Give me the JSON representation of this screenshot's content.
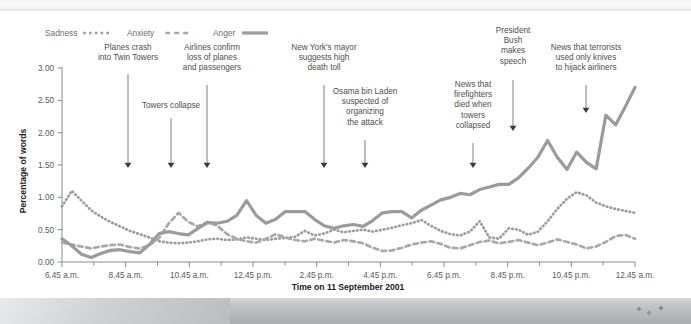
{
  "chart_data": {
    "type": "line",
    "title": "",
    "xlabel": "Time on 11 September 2001",
    "ylabel": "Percentage of words",
    "ylim": [
      0.0,
      3.0
    ],
    "y_ticks": [
      "0.00",
      "0.50",
      "1.00",
      "1.50",
      "2.00",
      "2.50",
      "3.00"
    ],
    "y_tick_values": [
      0.0,
      0.5,
      1.0,
      1.5,
      2.0,
      2.5,
      3.0
    ],
    "grid": false,
    "legend_position": "top-left",
    "x_tick_labels": [
      "6.45 a.m.",
      "8.45 a.m.",
      "10.45 a.m.",
      "12.45 p.m.",
      "2.45 p.m.",
      "4.45 p.m.",
      "6.45 p.m.",
      "8.45 p.m.",
      "10.45 p.m.",
      "12.45 a.m."
    ],
    "x_minor_ticks_per_label": 2,
    "x_hours": [
      6.75,
      7.75,
      8.75,
      9.75,
      10.75,
      11.75,
      12.75,
      13.75,
      14.75,
      15.75,
      16.75,
      17.75,
      18.75,
      19.75,
      20.75,
      21.75,
      22.75,
      23.75,
      24.75
    ],
    "series": [
      {
        "name": "Sadness",
        "style": "dotted",
        "color": "#9b9c9e",
        "values": [
          0.86,
          1.1,
          0.95,
          0.8,
          0.7,
          0.62,
          0.55,
          0.48,
          0.43,
          0.38,
          0.32,
          0.3,
          0.29,
          0.3,
          0.32,
          0.35,
          0.36,
          0.34,
          0.35,
          0.38,
          0.36,
          0.34,
          0.36,
          0.37,
          0.39,
          0.48,
          0.41,
          0.44,
          0.5,
          0.46,
          0.48,
          0.5,
          0.47,
          0.5,
          0.53,
          0.57,
          0.6,
          0.65,
          0.56,
          0.48,
          0.43,
          0.41,
          0.47,
          0.63,
          0.38,
          0.36,
          0.52,
          0.5,
          0.42,
          0.47,
          0.63,
          0.82,
          0.98,
          1.08,
          1.03,
          0.92,
          0.86,
          0.82,
          0.79,
          0.76
        ]
      },
      {
        "name": "Anxiety",
        "style": "dashed",
        "color": "#a7a8aa",
        "values": [
          0.3,
          0.27,
          0.24,
          0.21,
          0.24,
          0.26,
          0.27,
          0.23,
          0.21,
          0.26,
          0.37,
          0.6,
          0.76,
          0.62,
          0.55,
          0.62,
          0.56,
          0.43,
          0.36,
          0.32,
          0.3,
          0.36,
          0.43,
          0.38,
          0.34,
          0.32,
          0.36,
          0.33,
          0.3,
          0.34,
          0.32,
          0.29,
          0.22,
          0.17,
          0.18,
          0.22,
          0.27,
          0.3,
          0.32,
          0.28,
          0.22,
          0.21,
          0.26,
          0.31,
          0.33,
          0.29,
          0.31,
          0.34,
          0.3,
          0.26,
          0.3,
          0.35,
          0.31,
          0.27,
          0.21,
          0.24,
          0.31,
          0.4,
          0.42,
          0.36
        ]
      },
      {
        "name": "Anger",
        "style": "solid",
        "color": "#9a9b9d",
        "values": [
          0.36,
          0.25,
          0.12,
          0.07,
          0.13,
          0.18,
          0.19,
          0.16,
          0.14,
          0.27,
          0.44,
          0.47,
          0.44,
          0.42,
          0.52,
          0.61,
          0.6,
          0.63,
          0.72,
          0.95,
          0.72,
          0.6,
          0.66,
          0.78,
          0.78,
          0.78,
          0.66,
          0.56,
          0.52,
          0.56,
          0.58,
          0.55,
          0.64,
          0.76,
          0.78,
          0.78,
          0.68,
          0.8,
          0.88,
          0.96,
          1.0,
          1.06,
          1.04,
          1.12,
          1.16,
          1.2,
          1.2,
          1.3,
          1.45,
          1.62,
          1.88,
          1.62,
          1.43,
          1.7,
          1.54,
          1.44,
          2.27,
          2.12,
          2.4,
          2.7
        ]
      }
    ],
    "annotations": [
      {
        "id": "planes-crash",
        "lines": [
          "Planes crash",
          "into Twin Towers"
        ],
        "text_x": 128,
        "text_top": 50,
        "arrow_x": 128,
        "arrow_from": 74,
        "arrow_to": 168,
        "align": "center"
      },
      {
        "id": "towers-collapse",
        "lines": [
          "Towers collapse"
        ],
        "text_x": 171,
        "text_top": 108,
        "arrow_x": 171,
        "arrow_from": 118,
        "arrow_to": 168,
        "align": "center"
      },
      {
        "id": "airlines-confirm",
        "lines": [
          "Airlines confirm",
          "loss of planes",
          "and passengers"
        ],
        "text_x": 212,
        "text_top": 50,
        "arrow_x": 207,
        "arrow_from": 85,
        "arrow_to": 168,
        "align": "center"
      },
      {
        "id": "nyc-mayor",
        "lines": [
          "New York's mayor",
          "suggests high",
          "death toll"
        ],
        "text_x": 324,
        "text_top": 50,
        "arrow_x": 324,
        "arrow_from": 85,
        "arrow_to": 168,
        "align": "center"
      },
      {
        "id": "bin-laden",
        "lines": [
          "Osama bin Laden",
          "suspected of",
          "organizing",
          "the attack"
        ],
        "text_x": 365,
        "text_top": 94,
        "arrow_x": 365,
        "arrow_from": 140,
        "arrow_to": 168,
        "align": "center"
      },
      {
        "id": "firefighters-died",
        "lines": [
          "News that",
          "firefighters",
          "died when",
          "towers",
          "collapsed"
        ],
        "text_x": 473,
        "text_top": 87,
        "arrow_x": 473,
        "arrow_from": 143,
        "arrow_to": 168,
        "align": "center"
      },
      {
        "id": "bush-speech",
        "lines": [
          "President",
          "Bush",
          "makes",
          "speech"
        ],
        "text_x": 513,
        "text_top": 33,
        "arrow_x": 513,
        "arrow_from": 80,
        "arrow_to": 131,
        "align": "center"
      },
      {
        "id": "terrorists-knives",
        "lines": [
          "News that terrorists",
          "used only knives",
          "to hijack airliners"
        ],
        "text_x": 586,
        "text_top": 50,
        "arrow_x": 586,
        "arrow_from": 85,
        "arrow_to": 113,
        "align": "center"
      }
    ]
  },
  "legend": {
    "items": [
      {
        "label": "Sadness",
        "style": "dotted"
      },
      {
        "label": "Anxiety",
        "style": "dashed"
      },
      {
        "label": "Anger",
        "style": "solid"
      }
    ]
  },
  "axes": {
    "y_title": "Percentage of words",
    "x_title": "Time on 11 September 2001"
  },
  "colors": {
    "background": "#ffffff",
    "line_gray": "#9b9c9e",
    "text_gray": "#58595b",
    "axis_gray": "#8a8b8d",
    "arrow_gray": "#6e6f71",
    "title_black": "#1b1b1b"
  }
}
